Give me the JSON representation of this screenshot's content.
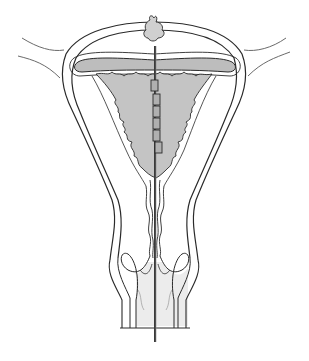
{
  "diagram": {
    "labels": [],
    "colors": {
      "background": "#ffffff",
      "outline": "#2a2a2a",
      "thin_outline": "#6a6a6a",
      "endometrium_fill": "#c4c4c4",
      "cavity_fill": "#bdbdbd",
      "vagina_fill": "#ececec",
      "device_rod": "#3a3a3a",
      "device_segment_fill": "#b0b0b0"
    },
    "device": {
      "segments_count": 6,
      "has_tip_tuft": true
    }
  }
}
